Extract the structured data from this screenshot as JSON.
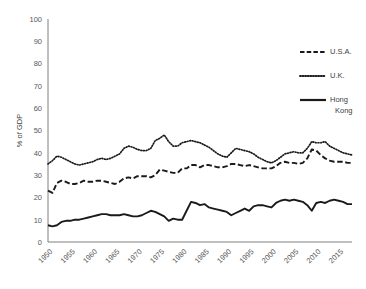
{
  "chart_data": {
    "type": "line",
    "title": "",
    "xlabel": "",
    "ylabel": "% of GDP",
    "ylim": [
      0,
      100
    ],
    "xlim": [
      1950,
      2018
    ],
    "ytick_labels": [
      "0",
      "10",
      "20",
      "30",
      "40",
      "50",
      "60",
      "70",
      "80",
      "90",
      "100"
    ],
    "ytick_values": [
      0,
      10,
      20,
      30,
      40,
      50,
      60,
      70,
      80,
      90,
      100
    ],
    "xtick_labels": [
      "1950",
      "1955",
      "1960",
      "1965",
      "1970",
      "1975",
      "1980",
      "1985",
      "1990",
      "1995",
      "2000",
      "2005",
      "2010",
      "2015"
    ],
    "xtick_values": [
      1950,
      1955,
      1960,
      1965,
      1970,
      1975,
      1980,
      1985,
      1990,
      1995,
      2000,
      2005,
      2010,
      2015
    ],
    "grid": false,
    "legend_position": "top-right",
    "x": [
      1950,
      1951,
      1952,
      1953,
      1954,
      1955,
      1956,
      1957,
      1958,
      1959,
      1960,
      1961,
      1962,
      1963,
      1964,
      1965,
      1966,
      1967,
      1968,
      1969,
      1970,
      1971,
      1972,
      1973,
      1974,
      1975,
      1976,
      1977,
      1978,
      1979,
      1980,
      1981,
      1982,
      1983,
      1984,
      1985,
      1986,
      1987,
      1988,
      1989,
      1990,
      1991,
      1992,
      1993,
      1994,
      1995,
      1996,
      1997,
      1998,
      1999,
      2000,
      2001,
      2002,
      2003,
      2004,
      2005,
      2006,
      2007,
      2008,
      2009,
      2010,
      2011,
      2012,
      2013,
      2014,
      2015,
      2016,
      2017,
      2018
    ],
    "series": [
      {
        "name": "U.S.A.",
        "style": "dashed",
        "color": "#1a1a1a",
        "values": [
          23.0,
          22.0,
          26.5,
          27.5,
          27.0,
          26.0,
          26.0,
          26.5,
          27.5,
          27.0,
          27.0,
          27.5,
          27.5,
          27.0,
          26.5,
          26.0,
          27.0,
          28.5,
          29.0,
          28.5,
          29.5,
          29.5,
          29.5,
          29.0,
          30.0,
          32.5,
          32.0,
          31.5,
          31.0,
          31.0,
          33.0,
          33.0,
          34.5,
          34.5,
          33.5,
          34.5,
          34.5,
          34.0,
          33.5,
          33.5,
          34.0,
          35.0,
          35.0,
          34.5,
          34.0,
          34.5,
          34.0,
          33.5,
          33.0,
          33.0,
          33.0,
          34.0,
          35.5,
          36.0,
          35.5,
          35.5,
          35.0,
          35.5,
          37.5,
          41.5,
          41.0,
          39.0,
          37.5,
          36.5,
          36.0,
          36.0,
          36.0,
          35.5,
          35.5
        ]
      },
      {
        "name": "U.K.",
        "style": "dotted",
        "color": "#1a1a1a",
        "values": [
          35.0,
          36.5,
          38.5,
          38.0,
          37.0,
          36.0,
          35.0,
          34.5,
          35.0,
          35.5,
          36.0,
          37.0,
          37.5,
          37.0,
          37.5,
          38.5,
          39.5,
          42.0,
          43.0,
          42.5,
          41.5,
          41.0,
          41.0,
          42.0,
          45.5,
          46.5,
          48.0,
          45.0,
          43.0,
          43.0,
          44.5,
          45.0,
          45.5,
          45.0,
          44.5,
          43.5,
          42.5,
          41.0,
          39.5,
          38.5,
          38.0,
          40.0,
          42.0,
          41.5,
          41.0,
          40.5,
          39.5,
          38.0,
          37.0,
          36.0,
          35.5,
          36.5,
          38.0,
          39.5,
          40.0,
          40.5,
          40.0,
          40.0,
          42.0,
          45.0,
          44.5,
          44.5,
          45.0,
          43.0,
          42.0,
          41.0,
          40.0,
          39.5,
          39.0
        ]
      },
      {
        "name": "Hong Kong",
        "style": "solid",
        "color": "#1a1a1a",
        "values": [
          7.5,
          7.0,
          7.5,
          9.0,
          9.5,
          9.5,
          10.0,
          10.0,
          10.5,
          11.0,
          11.5,
          12.0,
          12.5,
          12.5,
          12.0,
          12.0,
          12.0,
          12.5,
          12.0,
          11.5,
          11.5,
          12.0,
          13.0,
          14.0,
          13.5,
          12.5,
          11.5,
          9.5,
          10.5,
          10.0,
          10.0,
          14.0,
          18.0,
          17.5,
          16.5,
          17.0,
          15.5,
          15.0,
          14.5,
          14.0,
          13.5,
          12.0,
          13.0,
          14.0,
          15.0,
          14.0,
          16.0,
          16.5,
          16.5,
          16.0,
          15.5,
          17.5,
          18.5,
          19.0,
          18.5,
          19.0,
          18.5,
          18.0,
          16.5,
          14.0,
          17.5,
          18.0,
          17.5,
          18.5,
          19.0,
          18.5,
          18.0,
          17.0,
          17.0
        ]
      }
    ]
  },
  "legend": {
    "items": [
      {
        "label": "U.S.A.",
        "style": "dashed"
      },
      {
        "label": "U.K.",
        "style": "dotted"
      },
      {
        "label": "Hong",
        "label2": "Kong",
        "style": "solid"
      }
    ]
  },
  "colors": {
    "series": "#1a1a1a",
    "axis": "#808080",
    "text": "#404040",
    "background": "#ffffff"
  }
}
